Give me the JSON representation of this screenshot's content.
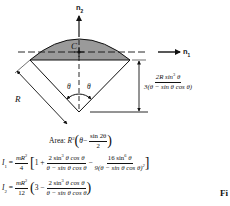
{
  "figure": {
    "axis_labels": {
      "n1": "n",
      "n1_sub": "1",
      "n2": "n",
      "n2_sub": "2"
    },
    "centroid_label": "C",
    "radius_label": "R",
    "angle_left": "θ",
    "angle_right": "θ",
    "distance": {
      "numerator": "2R sin",
      "numerator_exp": "3",
      "numerator_tail": " θ",
      "denominator": "3(θ − sin θ cos θ)"
    },
    "colors": {
      "segment_fill": "#9a9a9a",
      "ink": "#111111"
    }
  },
  "formulas": {
    "area": {
      "label": "Area:",
      "lead": "R",
      "lead_exp": "2",
      "paren_open": "(",
      "theta": "θ",
      "minus": "−",
      "num": "sin 2θ",
      "den": "2",
      "paren_close": ")"
    },
    "i1": {
      "lhs": "I",
      "lhs_sub": "1",
      "eq": "=",
      "coef_num": "mR",
      "coef_exp": "2",
      "coef_den": "4",
      "bracket_open": "[",
      "one": "1 +",
      "t1_num": "2 sin",
      "t1_num_exp": "3",
      "t1_num_tail": " θ cos θ",
      "t1_den": "θ − sin θ cos θ",
      "minus": "−",
      "t2_num": "16 sin",
      "t2_num_exp": "6",
      "t2_num_tail": " θ",
      "t2_den": "9(θ − sin θ cos θ)",
      "t2_den_exp": "2",
      "bracket_close": "]"
    },
    "i2": {
      "lhs": "I",
      "lhs_sub": "2",
      "eq": "=",
      "coef_num": "mR",
      "coef_exp": "2",
      "coef_den": "12",
      "paren_open": "(",
      "three": "3 −",
      "t_num": "2 sin",
      "t_num_exp": "3",
      "t_num_tail": " θ cos θ",
      "t_den": "θ − sin θ cos θ",
      "paren_close": ")"
    }
  },
  "caption_fragment": "Fi"
}
